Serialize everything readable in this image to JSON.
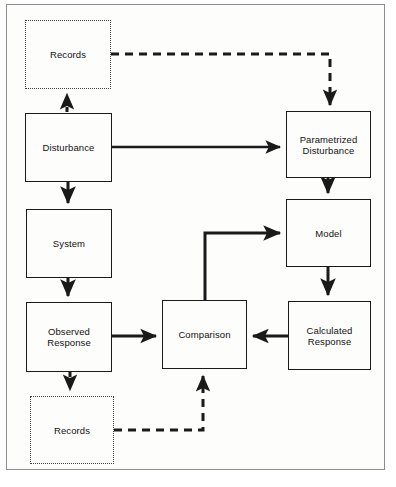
{
  "diagram": {
    "background_color": "#fdfdfc",
    "frame_color": "#8d8d8d",
    "solid_line_color": "#1a1a1a",
    "dotted_line_color": "#3d3d3d",
    "caption": "",
    "nodes": [
      {
        "id": "records-top",
        "label": "Records",
        "style": "dotted",
        "x": 25,
        "y": 20,
        "w": 86,
        "h": 69
      },
      {
        "id": "disturbance",
        "label": "Disturbance",
        "style": "solid",
        "x": 25,
        "y": 113,
        "w": 87,
        "h": 69
      },
      {
        "id": "parametrized",
        "label": "Parametrized\nDisturbance",
        "style": "solid",
        "x": 286,
        "y": 111,
        "w": 85,
        "h": 67
      },
      {
        "id": "system",
        "label": "System",
        "style": "solid",
        "x": 26,
        "y": 209,
        "w": 86,
        "h": 69
      },
      {
        "id": "model",
        "label": "Model",
        "style": "solid",
        "x": 286,
        "y": 199,
        "w": 85,
        "h": 68
      },
      {
        "id": "observed-response",
        "label": "Observed\nResponse",
        "style": "solid",
        "x": 26,
        "y": 302,
        "w": 86,
        "h": 70
      },
      {
        "id": "comparison",
        "label": "Comparison",
        "style": "solid",
        "x": 162,
        "y": 300,
        "w": 85,
        "h": 69
      },
      {
        "id": "calculated-response",
        "label": "Calculated\nResponse",
        "style": "solid",
        "x": 288,
        "y": 301,
        "w": 83,
        "h": 69
      },
      {
        "id": "records-bottom",
        "label": "Records",
        "style": "dotted",
        "x": 30,
        "y": 396,
        "w": 84,
        "h": 68
      }
    ],
    "connectors": [
      {
        "id": "disturbance-to-records-top",
        "style": "dashed",
        "from": "disturbance",
        "to": "records-top"
      },
      {
        "id": "records-top-to-parametrized",
        "style": "dashed",
        "from": "records-top",
        "to": "parametrized"
      },
      {
        "id": "disturbance-to-parametrized",
        "style": "solid",
        "from": "disturbance",
        "to": "parametrized"
      },
      {
        "id": "disturbance-to-system",
        "style": "solid",
        "from": "disturbance",
        "to": "system"
      },
      {
        "id": "parametrized-to-model",
        "style": "solid",
        "from": "parametrized",
        "to": "model"
      },
      {
        "id": "system-to-observed-response",
        "style": "solid",
        "from": "system",
        "to": "observed-response"
      },
      {
        "id": "model-to-calculated-response",
        "style": "solid",
        "from": "model",
        "to": "calculated-response"
      },
      {
        "id": "observed-response-to-comparison",
        "style": "solid",
        "from": "observed-response",
        "to": "comparison"
      },
      {
        "id": "calculated-response-to-comparison",
        "style": "solid",
        "from": "calculated-response",
        "to": "comparison"
      },
      {
        "id": "comparison-to-model",
        "style": "solid",
        "from": "comparison",
        "to": "model"
      },
      {
        "id": "observed-response-to-records-bottom",
        "style": "dashed",
        "from": "observed-response",
        "to": "records-bottom"
      },
      {
        "id": "records-bottom-to-comparison",
        "style": "dashed",
        "from": "records-bottom",
        "to": "comparison"
      }
    ]
  }
}
